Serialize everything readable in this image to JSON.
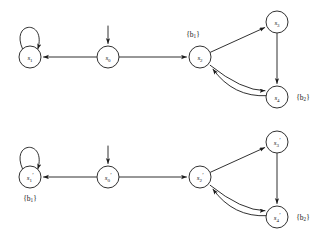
{
  "figure": {
    "background_color": "#ffffff",
    "stroke_color": "#1a1a1a",
    "node_radius": 11
  },
  "diagrams": [
    {
      "id": "top-transition-system",
      "nodes": [
        {
          "id": "s1",
          "base": "s",
          "sub": "1",
          "prime": "",
          "cx": 30,
          "cy": 57,
          "self_loop": true,
          "start": false
        },
        {
          "id": "s0",
          "base": "s",
          "sub": "0",
          "prime": "",
          "cx": 108,
          "cy": 57,
          "self_loop": false,
          "start": true
        },
        {
          "id": "s2",
          "base": "s",
          "sub": "2",
          "prime": "",
          "cx": 200,
          "cy": 57,
          "self_loop": false,
          "start": false
        },
        {
          "id": "s3",
          "base": "s",
          "sub": "3",
          "prime": "",
          "cx": 277,
          "cy": 22,
          "self_loop": false,
          "start": false
        },
        {
          "id": "s4",
          "base": "s",
          "sub": "4",
          "prime": "",
          "cx": 277,
          "cy": 97,
          "self_loop": false,
          "start": false
        }
      ],
      "set_labels": [
        {
          "id": "label-b1-top",
          "base": "b",
          "sub": "1",
          "x": 193,
          "y": 34,
          "for_node": "s2"
        },
        {
          "id": "label-b2-top",
          "base": "b",
          "sub": "2",
          "x": 303,
          "y": 97,
          "for_node": "s4"
        }
      ],
      "edges": [
        {
          "id": "e-s0-s1",
          "from": "s0",
          "to": "s1",
          "kind": "straight"
        },
        {
          "id": "e-s0-s2",
          "from": "s0",
          "to": "s2",
          "kind": "straight"
        },
        {
          "id": "e-s2-s3",
          "from": "s2",
          "to": "s3",
          "kind": "straight"
        },
        {
          "id": "e-s3-s4",
          "from": "s3",
          "to": "s4",
          "kind": "straight"
        },
        {
          "id": "e-s2-s4",
          "from": "s2",
          "to": "s4",
          "kind": "curve-down"
        },
        {
          "id": "e-s4-s2",
          "from": "s4",
          "to": "s2",
          "kind": "curve-up"
        },
        {
          "id": "e-s1-s1",
          "from": "s1",
          "to": "s1",
          "kind": "self-loop"
        }
      ]
    },
    {
      "id": "bottom-transition-system",
      "nodes": [
        {
          "id": "s1p",
          "base": "s",
          "sub": "1",
          "prime": "′",
          "cx": 30,
          "cy": 177,
          "self_loop": true,
          "start": false
        },
        {
          "id": "s0p",
          "base": "s",
          "sub": "0",
          "prime": "′",
          "cx": 108,
          "cy": 177,
          "self_loop": false,
          "start": true
        },
        {
          "id": "s2p",
          "base": "s",
          "sub": "2",
          "prime": "′",
          "cx": 200,
          "cy": 177,
          "self_loop": false,
          "start": false
        },
        {
          "id": "s3p",
          "base": "s",
          "sub": "3",
          "prime": "′",
          "cx": 277,
          "cy": 142,
          "self_loop": false,
          "start": false
        },
        {
          "id": "s4p",
          "base": "s",
          "sub": "4",
          "prime": "′",
          "cx": 277,
          "cy": 217,
          "self_loop": false,
          "start": false
        }
      ],
      "set_labels": [
        {
          "id": "label-b1-bottom",
          "base": "b",
          "sub": "1",
          "x": 30,
          "y": 198,
          "for_node": "s1p"
        },
        {
          "id": "label-b2-bottom",
          "base": "b",
          "sub": "2",
          "x": 303,
          "y": 217,
          "for_node": "s4p"
        }
      ],
      "edges": [
        {
          "id": "e-s0p-s1p",
          "from": "s0p",
          "to": "s1p",
          "kind": "straight"
        },
        {
          "id": "e-s0p-s2p",
          "from": "s0p",
          "to": "s2p",
          "kind": "straight"
        },
        {
          "id": "e-s2p-s3p",
          "from": "s2p",
          "to": "s3p",
          "kind": "straight"
        },
        {
          "id": "e-s3p-s4p",
          "from": "s3p",
          "to": "s4p",
          "kind": "straight"
        },
        {
          "id": "e-s2p-s4p",
          "from": "s2p",
          "to": "s4p",
          "kind": "curve-down"
        },
        {
          "id": "e-s4p-s2p",
          "from": "s4p",
          "to": "s2p",
          "kind": "curve-up"
        },
        {
          "id": "e-s1p-s1p",
          "from": "s1p",
          "to": "s1p",
          "kind": "self-loop"
        }
      ]
    }
  ]
}
